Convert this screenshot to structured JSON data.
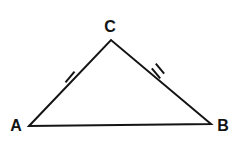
{
  "figure": {
    "kind": "geometry-diagram",
    "shape": "triangle",
    "background_color": "#ffffff",
    "stroke_color": "#141414",
    "stroke_width": 2,
    "canvas": {
      "width": 237,
      "height": 145
    }
  },
  "vertices": [
    {
      "id": "A",
      "label": "A",
      "x": 29,
      "y": 126,
      "label_x": 16,
      "label_y": 126
    },
    {
      "id": "B",
      "label": "B",
      "x": 211,
      "y": 124,
      "label_x": 223,
      "label_y": 126
    },
    {
      "id": "C",
      "label": "C",
      "x": 111,
      "y": 40,
      "label_x": 110,
      "label_y": 27
    }
  ],
  "sides": [
    {
      "id": "AB",
      "from": "A",
      "to": "B",
      "ticks": 0
    },
    {
      "id": "AC",
      "from": "A",
      "to": "C",
      "ticks": 1
    },
    {
      "id": "BC",
      "from": "B",
      "to": "C",
      "ticks": 2
    }
  ],
  "tick_marks": [
    {
      "id": "tick-ac",
      "side": "AC",
      "count": 1,
      "x": 70,
      "y": 77,
      "angle_deg": 40
    },
    {
      "id": "tick-bc",
      "side": "BC",
      "count": 2,
      "x": 158,
      "y": 71,
      "angle_deg": -40
    }
  ],
  "geometry_paths": {
    "triangle_points": "29,126 111,40 211,124",
    "tick_ac": "M 70 70 L 70 84",
    "tick_bc_1": "M 155 65 L 155 78",
    "tick_bc_2": "M 161 64 L 161 77"
  }
}
